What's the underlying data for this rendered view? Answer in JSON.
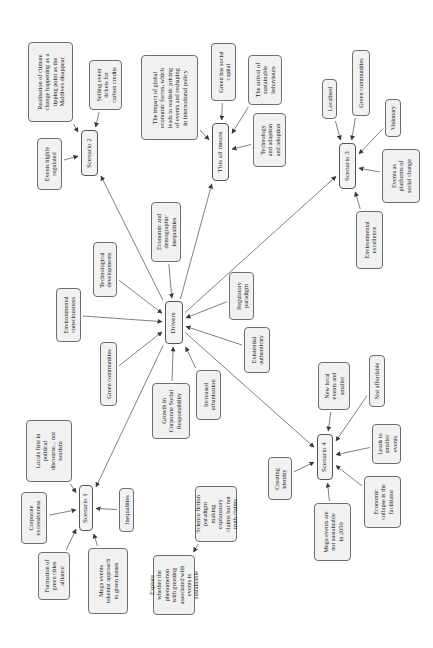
{
  "diagram": {
    "title": "",
    "orientation": "rotated-90-ccw",
    "nodes": {
      "drivers": {
        "label": "Drivers",
        "x": 165,
        "y": 301,
        "w": 18,
        "h": 43
      },
      "scenario1": {
        "label": "Scenario 1",
        "x": 79,
        "y": 485,
        "w": 14,
        "h": 46
      },
      "scenario2": {
        "label": "Scenario 2",
        "x": 81,
        "y": 130,
        "w": 17,
        "h": 46
      },
      "scenario3": {
        "label": "Scenario 3",
        "x": 339,
        "y": 143,
        "w": 17,
        "h": 46
      },
      "scenario4": {
        "label": "Scenario 4",
        "x": 317,
        "y": 434,
        "w": 16,
        "h": 46
      },
      "this_all_means": {
        "label": "This all means",
        "x": 212,
        "y": 123,
        "w": 17,
        "h": 58
      },
      "realisation": {
        "label": "Realisation of climate\nchange happening as a\ntipping point as the\nMaldives disappear",
        "x": 28,
        "y": 42,
        "w": 45,
        "h": 80
      },
      "highly_regulated": {
        "label": "Events highly\nregulated",
        "x": 37,
        "y": 138,
        "w": 25,
        "h": 52
      },
      "selling_tickets": {
        "label": "Selling event\ntickets for\ncarbon credits",
        "x": 89,
        "y": 60,
        "w": 33,
        "h": 50
      },
      "global_forces": {
        "label": "The impact of global\neconomic forces, which\nleads to realistic pricing\nof events and reshaping\nin international policy",
        "x": 141,
        "y": 55,
        "w": 57,
        "h": 85
      },
      "green_social_capital": {
        "label": "Green has social\ncapital",
        "x": 211,
        "y": 43,
        "w": 25,
        "h": 58
      },
      "sustainable_behaviours": {
        "label": "The arrival of\nsustainable\nbehaviours",
        "x": 248,
        "y": 55,
        "w": 34,
        "h": 50
      },
      "technology_adoption": {
        "label": "Technology\nand adaption\nand adoption",
        "x": 253,
        "y": 113,
        "w": 33,
        "h": 54
      },
      "localised": {
        "label": "Localised",
        "x": 322,
        "y": 79,
        "w": 15,
        "h": 40
      },
      "green_communities_s3": {
        "label": "Green communities",
        "x": 352,
        "y": 50,
        "w": 18,
        "h": 66
      },
      "visionary": {
        "label": "Visionary",
        "x": 385,
        "y": 99,
        "w": 16,
        "h": 38
      },
      "platforms_social_change": {
        "label": "Events as\nplatforms of\nsocial change",
        "x": 382,
        "y": 149,
        "w": 38,
        "h": 54
      },
      "environmental_excellence": {
        "label": "Environmental\nexcellence",
        "x": 356,
        "y": 211,
        "w": 27,
        "h": 58
      },
      "economic_demographic": {
        "label": "Economic and\ndemographic\ninequalities",
        "x": 151,
        "y": 202,
        "w": 30,
        "h": 60
      },
      "technological_developments": {
        "label": "Technological\ndevelopments",
        "x": 93,
        "y": 242,
        "w": 24,
        "h": 55
      },
      "environmental_consciousness": {
        "label": "Environmental\nconsciousness",
        "x": 56,
        "y": 288,
        "w": 25,
        "h": 54
      },
      "green_communities_d": {
        "label": "Green communities",
        "x": 100,
        "y": 342,
        "w": 17,
        "h": 64
      },
      "growth_csr": {
        "label": "Growth in\nCorporate Social\nResponsibility",
        "x": 152,
        "y": 383,
        "w": 38,
        "h": 56
      },
      "increased_urbanisation": {
        "label": "Increased\nurbanisation",
        "x": 196,
        "y": 370,
        "w": 25,
        "h": 50
      },
      "regulatory_paradigm": {
        "label": "Regulatory\nparadigm",
        "x": 229,
        "y": 272,
        "w": 25,
        "h": 48
      },
      "existential_authenticity": {
        "label": "Existential\nauthenticity",
        "x": 244,
        "y": 327,
        "w": 26,
        "h": 46
      },
      "new_local_events": {
        "label": "New local\nevents and\nsmaller",
        "x": 318,
        "y": 362,
        "w": 32,
        "h": 48
      },
      "not_affordable": {
        "label": "Not affordable",
        "x": 369,
        "y": 355,
        "w": 16,
        "h": 52
      },
      "creating_identity": {
        "label": "Creating\nidentity",
        "x": 268,
        "y": 457,
        "w": 24,
        "h": 43
      },
      "leads_smaller": {
        "label": "Leads to\nsmaller\nevents",
        "x": 372,
        "y": 424,
        "w": 29,
        "h": 40
      },
      "mega_not_sustainable": {
        "label": "Mega events are\nnot sustainable\nin 2050",
        "x": 314,
        "y": 503,
        "w": 37,
        "h": 58
      },
      "economic_collapse": {
        "label": "Economic\ncollapse is the\nfacilitator",
        "x": 364,
        "y": 476,
        "w": 37,
        "h": 52
      },
      "locals_first": {
        "label": "Locals first in\npolitical\ndiscourse... not\ntourism",
        "x": 26,
        "y": 420,
        "w": 46,
        "h": 62
      },
      "corporate_excessiveness": {
        "label": "Corporate\nexcessiveness",
        "x": 21,
        "y": 492,
        "w": 26,
        "h": 52
      },
      "inequalities": {
        "label": "Inequalities",
        "x": 119,
        "y": 488,
        "w": 15,
        "h": 44
      },
      "green_cities_alliance": {
        "label": "Formation of\ngreen cities\nalliance",
        "x": 38,
        "y": 552,
        "w": 32,
        "h": 48
      },
      "mega_tokenist": {
        "label": "Mega events\ntokenist approach\nto green issues",
        "x": 88,
        "y": 548,
        "w": 40,
        "h": 66
      },
      "science_fiction": {
        "label": "Science fiction\nparadigm\nmaking\nexplanatory\nclaims but not\ntruth claims",
        "x": 195,
        "y": 486,
        "w": 42,
        "h": 56
      },
      "explore_whether": {
        "label": "Explore\nwhether the\nphenomenon\nwith greening\nassociated with\nevents is\nsustainable",
        "x": 153,
        "y": 555,
        "w": 42,
        "h": 60
      }
    },
    "edges": [
      [
        "realisation",
        "scenario2"
      ],
      [
        "highly_regulated",
        "scenario2"
      ],
      [
        "selling_tickets",
        "scenario2"
      ],
      [
        "drivers",
        "scenario2"
      ],
      [
        "global_forces",
        "this_all_means"
      ],
      [
        "green_social_capital",
        "this_all_means"
      ],
      [
        "sustainable_behaviours",
        "this_all_means"
      ],
      [
        "technology_adoption",
        "this_all_means"
      ],
      [
        "drivers",
        "this_all_means"
      ],
      [
        "localised",
        "scenario3"
      ],
      [
        "green_communities_s3",
        "scenario3"
      ],
      [
        "visionary",
        "scenario3"
      ],
      [
        "platforms_social_change",
        "scenario3"
      ],
      [
        "environmental_excellence",
        "scenario3"
      ],
      [
        "drivers",
        "scenario3"
      ],
      [
        "economic_demographic",
        "drivers"
      ],
      [
        "technological_developments",
        "drivers"
      ],
      [
        "environmental_consciousness",
        "drivers"
      ],
      [
        "green_communities_d",
        "drivers"
      ],
      [
        "growth_csr",
        "drivers"
      ],
      [
        "increased_urbanisation",
        "drivers"
      ],
      [
        "regulatory_paradigm",
        "drivers"
      ],
      [
        "existential_authenticity",
        "drivers"
      ],
      [
        "new_local_events",
        "scenario4"
      ],
      [
        "not_affordable",
        "scenario4"
      ],
      [
        "creating_identity",
        "scenario4"
      ],
      [
        "leads_smaller",
        "scenario4"
      ],
      [
        "mega_not_sustainable",
        "scenario4"
      ],
      [
        "economic_collapse",
        "scenario4"
      ],
      [
        "drivers",
        "scenario4"
      ],
      [
        "locals_first",
        "scenario1"
      ],
      [
        "corporate_excessiveness",
        "scenario1"
      ],
      [
        "inequalities",
        "scenario1"
      ],
      [
        "green_cities_alliance",
        "scenario1"
      ],
      [
        "mega_tokenist",
        "scenario1"
      ],
      [
        "drivers",
        "scenario1"
      ],
      [
        "science_fiction",
        "explore_whether"
      ]
    ],
    "colors": {
      "box_fill": "#f1f1f1",
      "box_border": "#6e6e6e",
      "edge": "#4a4a4a",
      "text": "#2a2a2a"
    }
  }
}
